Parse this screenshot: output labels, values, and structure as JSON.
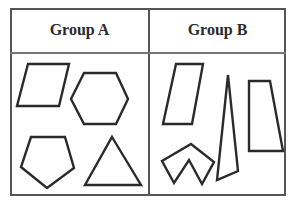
{
  "table": {
    "columns": [
      {
        "header": "Group A",
        "shapes": [
          {
            "name": "parallelogram",
            "points": "28,64 69,64 59,106 17,106"
          },
          {
            "name": "hexagon",
            "points": "84,73 116,73 128,99 116,124 84,124 71,99"
          },
          {
            "name": "pentagon",
            "points": "31,137 65,137 74,168 47,188 21,167"
          },
          {
            "name": "triangle",
            "points": "112,137 141,185 85,185"
          }
        ]
      },
      {
        "header": "Group B",
        "shapes": [
          {
            "name": "tall-parallelogram",
            "points": "176,64 203,64 192,124 163,124"
          },
          {
            "name": "thin-triangle",
            "points": "228,75 238,171 217,180"
          },
          {
            "name": "trapezoid",
            "points": "249,81 270,81 283,151 249,151"
          },
          {
            "name": "chevron",
            "points": "162,161 191,144 214,162 202,184 189,160 174,183"
          }
        ]
      }
    ]
  },
  "colors": {
    "stroke": "#2a2a2a",
    "border": "#555555",
    "background": "#ffffff"
  }
}
